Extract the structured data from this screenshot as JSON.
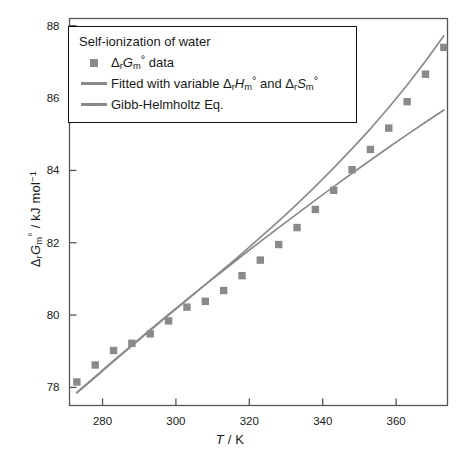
{
  "chart_data": {
    "type": "scatter",
    "title": "Self-ionization of water",
    "xlabel": "T / K",
    "ylabel": "ΔrGm° / kJ mol⁻¹",
    "xlim": [
      271,
      374
    ],
    "ylim": [
      77.5,
      88.2
    ],
    "xticks": [
      280,
      300,
      320,
      340,
      360
    ],
    "yticks": [
      78,
      80,
      82,
      84,
      86,
      88
    ],
    "grid": false,
    "legend_position": "top-left",
    "x": [
      273,
      278,
      283,
      288,
      293,
      298,
      303,
      308,
      313,
      318,
      323,
      328,
      333,
      338,
      343,
      348,
      353,
      358,
      363,
      368,
      373
    ],
    "series": [
      {
        "name": "ΔrGm° data",
        "type": "scatter",
        "marker": "square",
        "color": "#8a8a8a",
        "values": [
          78.15,
          78.62,
          79.02,
          79.22,
          79.48,
          79.84,
          80.22,
          80.38,
          80.68,
          81.09,
          81.52,
          81.95,
          82.42,
          82.92,
          83.45,
          84.02,
          84.58,
          85.17,
          85.9,
          86.66,
          87.4
        ]
      },
      {
        "name": "Fitted with variable ΔrHm° and ΔrSm°",
        "type": "line",
        "color": "#8a8a8a",
        "values": [
          77.85,
          78.28,
          78.72,
          79.15,
          79.58,
          80.0,
          80.42,
          80.84,
          81.27,
          81.7,
          82.15,
          82.6,
          83.07,
          83.56,
          84.07,
          84.6,
          85.15,
          85.74,
          86.36,
          87.02,
          87.72
        ]
      },
      {
        "name": "Gibb-Helmholtz Eq.",
        "type": "line",
        "color": "#8a8a8a",
        "values": [
          77.86,
          78.3,
          78.74,
          79.17,
          79.6,
          80.02,
          80.43,
          80.84,
          81.24,
          81.64,
          82.03,
          82.42,
          82.8,
          83.18,
          83.55,
          83.92,
          84.28,
          84.64,
          84.99,
          85.33,
          85.67
        ]
      }
    ]
  },
  "legend": {
    "title": "Self-ionization of water",
    "entries": [
      {
        "key": "square",
        "label_html": "Δ<sub>r</sub>G<sub>m</sub>° data"
      },
      {
        "key": "line",
        "label_html": "Fitted with variable Δ<sub>r</sub>H<sub>m</sub>° and Δ<sub>r</sub>S<sub>m</sub>°"
      },
      {
        "key": "line",
        "label_html": "Gibb-Helmholtz Eq."
      }
    ]
  },
  "axes": {
    "x_title": "T / K",
    "y_title": "ΔrGm° / kJ mol⁻¹",
    "x_tick_labels": [
      "280",
      "300",
      "320",
      "340",
      "360"
    ],
    "y_tick_labels": [
      "78",
      "80",
      "82",
      "84",
      "86",
      "88"
    ]
  },
  "colors": {
    "frame": "#444444",
    "data": "#8a8a8a",
    "text": "#1a1a1a",
    "background": "#ffffff"
  }
}
